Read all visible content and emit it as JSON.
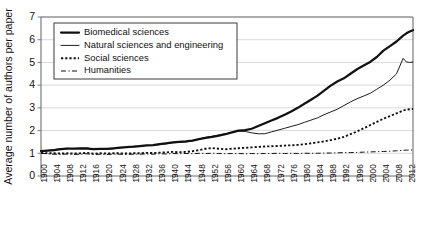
{
  "chart_data": {
    "type": "line",
    "title": "",
    "xlabel": "",
    "ylabel": "Average number of authors per paper",
    "xlim": [
      1900,
      2013
    ],
    "ylim": [
      0,
      7
    ],
    "y_ticks": [
      0,
      1,
      2,
      3,
      4,
      5,
      6,
      7
    ],
    "grid": "horizontal",
    "legend_position": "top-left",
    "x_tick_labels": [
      "1900",
      "1904",
      "1908",
      "1912",
      "1916",
      "1920",
      "1924",
      "1928",
      "1932",
      "1936",
      "1940",
      "1944",
      "1948",
      "1952",
      "1956",
      "1960",
      "1964",
      "1968",
      "1972",
      "1976",
      "1980",
      "1984",
      "1988",
      "1992",
      "1996",
      "2000",
      "2004",
      "2008",
      "2012"
    ],
    "x": [
      1900,
      1902,
      1904,
      1906,
      1908,
      1910,
      1912,
      1914,
      1916,
      1918,
      1920,
      1922,
      1924,
      1926,
      1928,
      1930,
      1932,
      1934,
      1936,
      1938,
      1940,
      1942,
      1944,
      1946,
      1948,
      1950,
      1952,
      1954,
      1956,
      1958,
      1960,
      1962,
      1964,
      1966,
      1968,
      1970,
      1972,
      1974,
      1976,
      1978,
      1980,
      1982,
      1984,
      1986,
      1988,
      1990,
      1992,
      1994,
      1996,
      1998,
      2000,
      2002,
      2004,
      2006,
      2008,
      2010,
      2011,
      2012,
      2013
    ],
    "series": [
      {
        "name": "Biomedical sciences",
        "style": "solid-thick",
        "color": "#111111",
        "values": [
          1.1,
          1.12,
          1.14,
          1.18,
          1.21,
          1.2,
          1.22,
          1.2,
          1.18,
          1.19,
          1.19,
          1.22,
          1.25,
          1.27,
          1.29,
          1.32,
          1.35,
          1.36,
          1.4,
          1.44,
          1.48,
          1.5,
          1.52,
          1.56,
          1.62,
          1.68,
          1.72,
          1.78,
          1.84,
          1.92,
          2.0,
          2.02,
          2.08,
          2.2,
          2.32,
          2.44,
          2.56,
          2.7,
          2.84,
          3.0,
          3.18,
          3.36,
          3.54,
          3.76,
          3.98,
          4.16,
          4.3,
          4.5,
          4.7,
          4.86,
          5.02,
          5.24,
          5.52,
          5.72,
          5.92,
          6.18,
          6.28,
          6.36,
          6.42
        ]
      },
      {
        "name": "Natural sciences and engineering",
        "style": "solid-thin",
        "color": "#111111",
        "values": [
          1.08,
          1.12,
          1.16,
          1.2,
          1.22,
          1.2,
          1.22,
          1.24,
          1.18,
          1.18,
          1.18,
          1.2,
          1.24,
          1.26,
          1.28,
          1.3,
          1.34,
          1.34,
          1.38,
          1.42,
          1.46,
          1.48,
          1.5,
          1.55,
          1.62,
          1.7,
          1.75,
          1.8,
          1.86,
          1.92,
          1.98,
          1.96,
          1.9,
          1.86,
          1.86,
          1.94,
          2.02,
          2.1,
          2.18,
          2.26,
          2.36,
          2.46,
          2.56,
          2.7,
          2.82,
          2.94,
          3.1,
          3.26,
          3.4,
          3.52,
          3.64,
          3.82,
          4.0,
          4.22,
          4.5,
          5.18,
          5.02,
          5.0,
          5.02
        ]
      },
      {
        "name": "Social sciences",
        "style": "dotted",
        "color": "#111111",
        "values": [
          1.02,
          1.0,
          1.0,
          0.99,
          1.0,
          0.99,
          1.0,
          1.02,
          0.98,
          1.0,
          0.99,
          1.0,
          1.0,
          0.99,
          1.0,
          1.0,
          1.02,
          1.01,
          1.03,
          1.04,
          1.06,
          1.05,
          1.06,
          1.09,
          1.14,
          1.2,
          1.23,
          1.2,
          1.18,
          1.2,
          1.22,
          1.24,
          1.26,
          1.28,
          1.3,
          1.31,
          1.32,
          1.34,
          1.35,
          1.37,
          1.4,
          1.44,
          1.48,
          1.52,
          1.58,
          1.64,
          1.72,
          1.84,
          1.96,
          2.1,
          2.24,
          2.38,
          2.52,
          2.64,
          2.76,
          2.88,
          2.92,
          2.94,
          2.95
        ]
      },
      {
        "name": "Humanities",
        "style": "dash-dot",
        "color": "#111111",
        "values": [
          1.0,
          0.98,
          0.96,
          0.95,
          0.97,
          0.95,
          0.96,
          0.98,
          0.94,
          0.96,
          0.95,
          0.96,
          0.96,
          0.95,
          0.96,
          0.96,
          0.97,
          0.96,
          0.98,
          0.97,
          0.99,
          0.98,
          0.99,
          0.98,
          1.0,
          0.99,
          1.0,
          0.99,
          0.98,
          0.99,
          0.99,
          0.98,
          0.99,
          0.98,
          0.99,
          0.99,
          1.0,
          0.99,
          1.0,
          0.99,
          1.0,
          1.0,
          1.0,
          1.01,
          1.01,
          1.02,
          1.03,
          1.03,
          1.04,
          1.05,
          1.06,
          1.07,
          1.08,
          1.09,
          1.11,
          1.13,
          1.14,
          1.14,
          1.15
        ]
      }
    ]
  },
  "legend": {
    "items": [
      {
        "label": "Biomedical sciences"
      },
      {
        "label": "Natural sciences and engineering"
      },
      {
        "label": "Social sciences"
      },
      {
        "label": "Humanities"
      }
    ]
  }
}
